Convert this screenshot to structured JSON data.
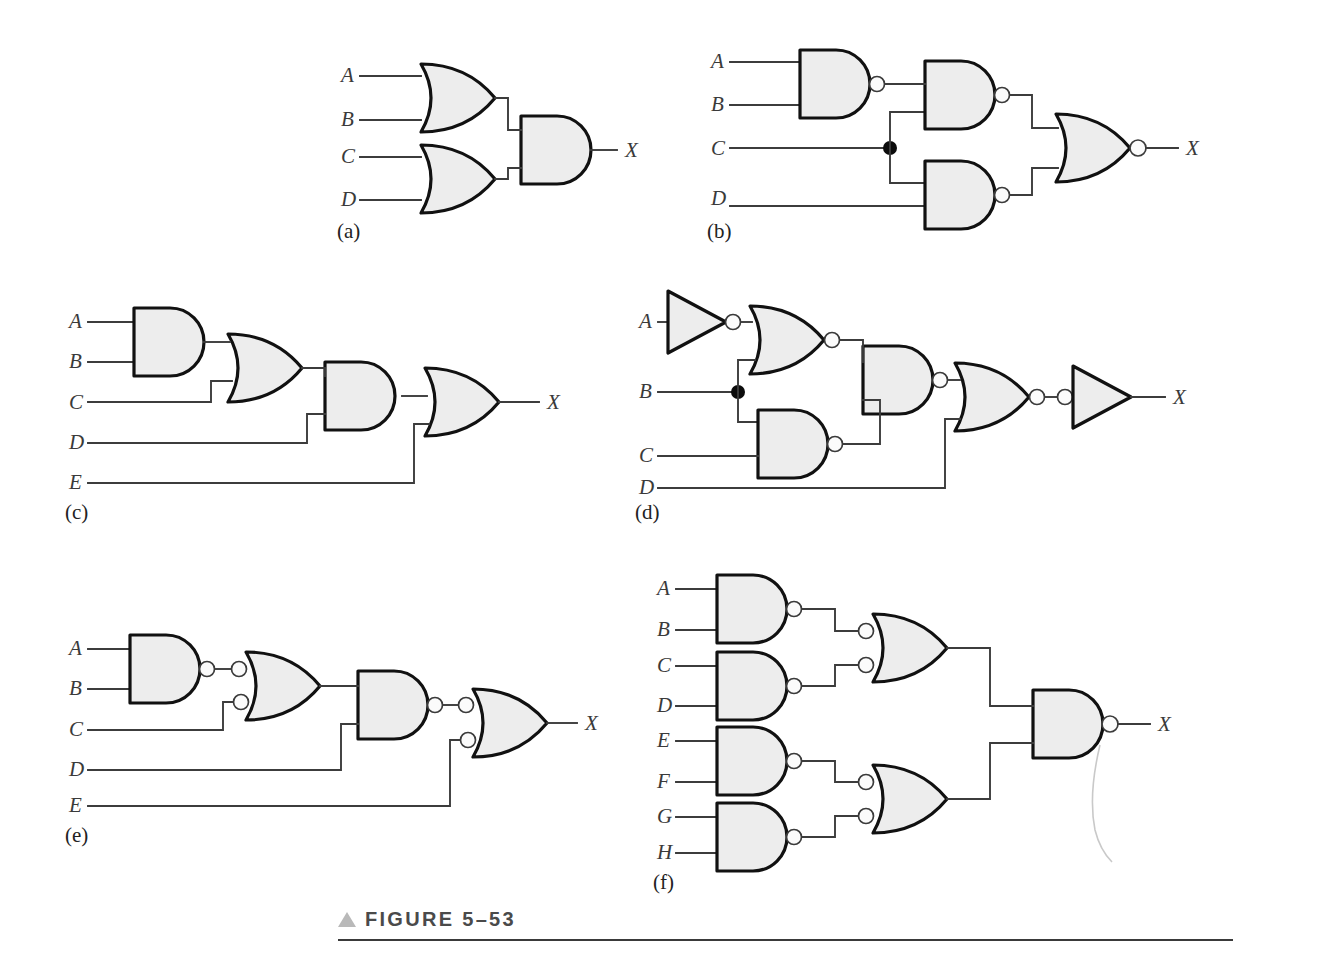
{
  "figure": {
    "caption_marker": "▲",
    "caption_text": "FIGURE 5–53",
    "output_label": "X",
    "colors": {
      "gate_fill": "#ededed",
      "gate_outline": "#111111",
      "wire": "#3c3c3c",
      "label_text": "#3a3a3a",
      "caption_text": "#4a4a4a",
      "caption_triangle": "#b9b9b9",
      "bubble_fill": "#fbfbfb",
      "junction_dot": "#0c0c0c",
      "page_background": "#ffffff"
    }
  },
  "circuits": [
    {
      "id": "a",
      "part_label": "(a)",
      "inputs": [
        "A",
        "B",
        "C",
        "D"
      ],
      "output": "X",
      "gates": [
        {
          "name": "or-gate-ab",
          "type": "OR",
          "inputs": [
            "A",
            "B"
          ]
        },
        {
          "name": "or-gate-cd",
          "type": "OR",
          "inputs": [
            "C",
            "D"
          ]
        },
        {
          "name": "and-gate-out",
          "type": "AND",
          "inputs": [
            "or-gate-ab",
            "or-gate-cd"
          ],
          "output": "X"
        }
      ],
      "junctions": 0
    },
    {
      "id": "b",
      "part_label": "(b)",
      "inputs": [
        "A",
        "B",
        "C",
        "D"
      ],
      "output": "X",
      "gates": [
        {
          "name": "nand-gate-ab",
          "type": "NAND",
          "inputs": [
            "A",
            "B"
          ]
        },
        {
          "name": "nand-gate-top",
          "type": "NAND",
          "inputs": [
            "nand-gate-ab",
            "C"
          ]
        },
        {
          "name": "nand-gate-bottom",
          "type": "NAND",
          "inputs": [
            "C",
            "D"
          ]
        },
        {
          "name": "nor-gate-out",
          "type": "NOR",
          "inputs": [
            "nand-gate-top",
            "nand-gate-bottom"
          ],
          "output": "X"
        }
      ],
      "junctions": 1
    },
    {
      "id": "c",
      "part_label": "(c)",
      "inputs": [
        "A",
        "B",
        "C",
        "D",
        "E"
      ],
      "output": "X",
      "gates": [
        {
          "name": "and-gate-ab",
          "type": "AND",
          "inputs": [
            "A",
            "B"
          ]
        },
        {
          "name": "or-gate-1",
          "type": "OR",
          "inputs": [
            "and-gate-ab",
            "C"
          ]
        },
        {
          "name": "and-gate-2",
          "type": "AND",
          "inputs": [
            "or-gate-1",
            "D"
          ]
        },
        {
          "name": "or-gate-out",
          "type": "OR",
          "inputs": [
            "and-gate-2",
            "E"
          ],
          "output": "X"
        }
      ],
      "junctions": 0
    },
    {
      "id": "d",
      "part_label": "(d)",
      "inputs": [
        "A",
        "B",
        "C",
        "D"
      ],
      "output": "X",
      "gates": [
        {
          "name": "inverter-a",
          "type": "NOT",
          "inputs": [
            "A"
          ]
        },
        {
          "name": "nor-gate-1",
          "type": "NOR",
          "inputs": [
            "inverter-a",
            "B"
          ]
        },
        {
          "name": "nand-gate-bc",
          "type": "NAND",
          "inputs": [
            "B",
            "C"
          ]
        },
        {
          "name": "nand-gate-2",
          "type": "NAND",
          "inputs": [
            "nor-gate-1",
            "nand-gate-bc"
          ]
        },
        {
          "name": "nor-gate-3",
          "type": "NOR",
          "inputs": [
            "nand-gate-2",
            "D"
          ]
        },
        {
          "name": "inverter-out",
          "type": "NOT-INPUT-BUBBLE",
          "inputs": [
            "nor-gate-3"
          ],
          "output": "X"
        }
      ],
      "junctions": 1
    },
    {
      "id": "e",
      "part_label": "(e)",
      "inputs": [
        "A",
        "B",
        "C",
        "D",
        "E"
      ],
      "output": "X",
      "gates": [
        {
          "name": "nand-gate-ab",
          "type": "NAND",
          "inputs": [
            "A",
            "B"
          ]
        },
        {
          "name": "neg-or-gate-1",
          "type": "NEG-INPUT-OR",
          "inputs": [
            "nand-gate-ab",
            "C"
          ]
        },
        {
          "name": "nand-gate-2",
          "type": "NAND",
          "inputs": [
            "neg-or-gate-1",
            "D"
          ]
        },
        {
          "name": "neg-or-gate-out",
          "type": "NEG-INPUT-OR",
          "inputs": [
            "nand-gate-2",
            "E"
          ],
          "output": "X"
        }
      ],
      "junctions": 0
    },
    {
      "id": "f",
      "part_label": "(f)",
      "inputs": [
        "A",
        "B",
        "C",
        "D",
        "E",
        "F",
        "G",
        "H"
      ],
      "output": "X",
      "gates": [
        {
          "name": "nand-gate-ab",
          "type": "NAND",
          "inputs": [
            "A",
            "B"
          ]
        },
        {
          "name": "nand-gate-cd",
          "type": "NAND",
          "inputs": [
            "C",
            "D"
          ]
        },
        {
          "name": "nand-gate-ef",
          "type": "NAND",
          "inputs": [
            "E",
            "F"
          ]
        },
        {
          "name": "nand-gate-gh",
          "type": "NAND",
          "inputs": [
            "G",
            "H"
          ]
        },
        {
          "name": "neg-or-gate-top",
          "type": "NEG-INPUT-OR",
          "inputs": [
            "nand-gate-ab",
            "nand-gate-cd"
          ]
        },
        {
          "name": "neg-or-gate-bottom",
          "type": "NEG-INPUT-OR",
          "inputs": [
            "nand-gate-ef",
            "nand-gate-gh"
          ]
        },
        {
          "name": "nand-gate-out",
          "type": "NAND",
          "inputs": [
            "neg-or-gate-top",
            "neg-or-gate-bottom"
          ],
          "output": "X"
        }
      ],
      "junctions": 0
    }
  ]
}
